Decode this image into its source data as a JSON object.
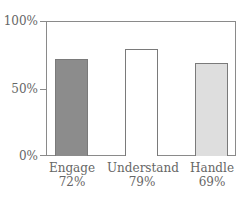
{
  "chart_data": {
    "type": "bar",
    "title": "",
    "xlabel": "",
    "ylabel": "",
    "categories": [
      "Engage",
      "Understand",
      "Handle"
    ],
    "values": [
      72,
      79,
      69
    ],
    "value_labels": [
      "72%",
      "79%",
      "69%"
    ],
    "bar_colors": [
      "#8c8c8c",
      "#ffffff",
      "#dedede"
    ],
    "ylim": [
      0,
      100
    ],
    "yticks": [
      0,
      50,
      100
    ],
    "ytick_labels": [
      "0%",
      "50%",
      "100%"
    ],
    "grid": false,
    "legend": null
  },
  "axis": {
    "y_labels": {
      "top": "100%",
      "mid": "50%",
      "bottom": "0%"
    }
  },
  "bars": [
    {
      "category": "Engage",
      "value_label": "72%"
    },
    {
      "category": "Understand",
      "value_label": "79%"
    },
    {
      "category": "Handle",
      "value_label": "69%"
    }
  ]
}
